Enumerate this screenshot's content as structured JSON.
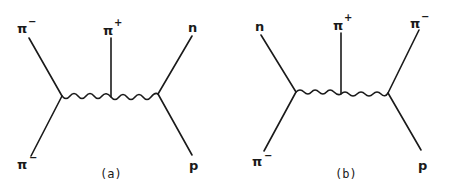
{
  "diagrams": [
    {
      "caption": "(a)",
      "labels": {
        "top_left": {
          "base": "π",
          "sup": "−"
        },
        "top_middle": {
          "base": "π",
          "sup": "+"
        },
        "top_right": {
          "base": "n",
          "sup": ""
        },
        "bottom_left": {
          "base": "π",
          "sup": "−"
        },
        "bottom_right": {
          "base": "p",
          "sup": ""
        }
      }
    },
    {
      "caption": "(b)",
      "labels": {
        "top_left": {
          "base": "n",
          "sup": ""
        },
        "top_middle": {
          "base": "π",
          "sup": "+"
        },
        "top_right": {
          "base": "π",
          "sup": "−"
        },
        "bottom_left": {
          "base": "π",
          "sup": "−"
        },
        "bottom_right": {
          "base": "p",
          "sup": ""
        }
      }
    }
  ]
}
